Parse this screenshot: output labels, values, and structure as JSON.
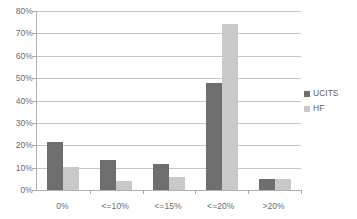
{
  "chart_data": {
    "type": "bar",
    "title": "",
    "subtitle": "",
    "xlabel": "",
    "ylabel": "",
    "categories": [
      "0%",
      "<=10%",
      "<=15%",
      "<=20%",
      ">20%"
    ],
    "series": [
      {
        "name": "UCITS",
        "color": "#6e6e6e",
        "values": [
          21.5,
          13.5,
          11.5,
          48.0,
          5.0
        ]
      },
      {
        "name": "HF",
        "color": "#c9c9c9",
        "values": [
          10.5,
          4.0,
          6.0,
          74.0,
          5.0
        ]
      }
    ],
    "ylim": [
      0,
      80
    ],
    "ytick_step": 10,
    "ytick_labels": [
      "0%",
      "10%",
      "20%",
      "30%",
      "40%",
      "50%",
      "60%",
      "70%",
      "80%"
    ],
    "ytick_values": [
      0,
      10,
      20,
      30,
      40,
      50,
      60,
      70,
      80
    ],
    "grid": true,
    "grid_axis": "y",
    "legend_position": "right",
    "legend_entries": [
      "UCITS",
      "HF"
    ],
    "annotations": []
  },
  "colors": {
    "series_ucits": "#6e6e6e",
    "series_hf": "#c9c9c9",
    "gridline": "#c4c4c4",
    "axis": "#b0b0b0",
    "tick_text": "#6b6b6b",
    "legend_text": "#5f5f5f",
    "background": "#ffffff"
  }
}
